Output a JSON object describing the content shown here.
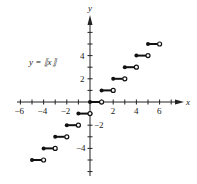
{
  "chart_data": {
    "type": "line",
    "title": "",
    "function_label": "y = ⟦x⟧",
    "xlabel": "x",
    "ylabel": "y",
    "xlim": [
      -7,
      7
    ],
    "ylim": [
      -6,
      7
    ],
    "x_tick_labels": [
      "−6",
      "−4",
      "−2",
      "2",
      "4",
      "6"
    ],
    "y_tick_labels": [
      "4",
      "2",
      "−2",
      "−4"
    ],
    "grid": false,
    "legend": null,
    "segments": [
      {
        "x_start": -5,
        "x_end": -4,
        "y": -5,
        "start": "closed",
        "end": "open"
      },
      {
        "x_start": -4,
        "x_end": -3,
        "y": -4,
        "start": "closed",
        "end": "open"
      },
      {
        "x_start": -3,
        "x_end": -2,
        "y": -3,
        "start": "closed",
        "end": "open"
      },
      {
        "x_start": -2,
        "x_end": -1,
        "y": -2,
        "start": "closed",
        "end": "open"
      },
      {
        "x_start": -1,
        "x_end": 0,
        "y": -1,
        "start": "closed",
        "end": "open"
      },
      {
        "x_start": 0,
        "x_end": 1,
        "y": 0,
        "start": "closed",
        "end": "open"
      },
      {
        "x_start": 1,
        "x_end": 2,
        "y": 1,
        "start": "closed",
        "end": "open"
      },
      {
        "x_start": 2,
        "x_end": 3,
        "y": 2,
        "start": "closed",
        "end": "open"
      },
      {
        "x_start": 3,
        "x_end": 4,
        "y": 3,
        "start": "closed",
        "end": "open"
      },
      {
        "x_start": 4,
        "x_end": 5,
        "y": 4,
        "start": "closed",
        "end": "open"
      },
      {
        "x_start": 5,
        "x_end": 6,
        "y": 5,
        "start": "closed",
        "end": "open"
      }
    ]
  }
}
